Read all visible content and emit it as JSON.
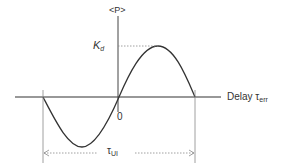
{
  "diagram": {
    "y_axis_label": "<P>",
    "peak_label_main": "K",
    "peak_label_sub": "d",
    "origin_label": "0",
    "x_axis_label_main": "Delay τ",
    "x_axis_label_sub": "err",
    "period_label_main": "τ",
    "period_label_sub": "UI"
  },
  "colors": {
    "stroke": "#333333",
    "guide": "#888888"
  }
}
